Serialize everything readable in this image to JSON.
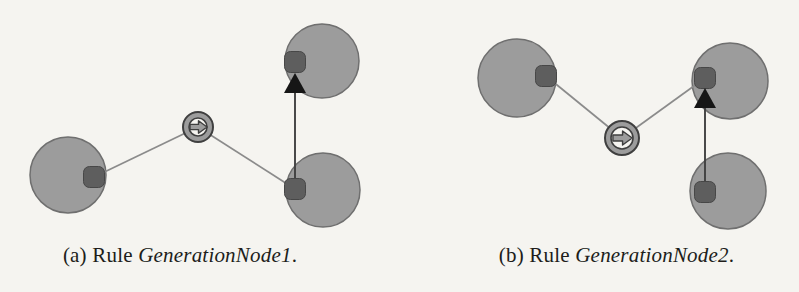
{
  "page": {
    "background": "#f5f4f0"
  },
  "colors": {
    "node_fill": "#9c9c9c",
    "node_stroke": "#6f6f6f",
    "port_fill": "#5e5e5e",
    "port_stroke": "#474747",
    "edge": "#8b8b8b",
    "arrow_line": "#414141",
    "arrow_head": "#161616",
    "icon_ring_fill": "#9c9c9c",
    "icon_stroke": "#3f3f3f",
    "icon_inner_bg": "#f5f4f0",
    "icon_arrow_fill": "#9c9c9c",
    "caption_color": "#201d1a"
  },
  "metrics": {
    "port_size": 21,
    "port_corner_radius": 6,
    "node_stroke_width": 1.5,
    "edge_width": 1.7,
    "arrow_line_width": 1.9,
    "arrow_head_width": 22,
    "arrow_head_height": 20
  },
  "figures": [
    {
      "id": "a",
      "caption": {
        "prefix": "(a) Rule ",
        "rule": "GenerationNode1",
        "suffix": "."
      },
      "svg": {
        "width": 400,
        "height": 234
      },
      "nodes": [
        {
          "name": "left-node",
          "cx": 68,
          "cy": 175,
          "r": 38
        },
        {
          "name": "top-right-node",
          "cx": 322,
          "cy": 61,
          "r": 37
        },
        {
          "name": "bottom-right-node",
          "cx": 323,
          "cy": 190,
          "r": 37
        }
      ],
      "ports": [
        {
          "name": "left-node-port",
          "cx": 94,
          "cy": 177
        },
        {
          "name": "top-right-node-port",
          "cx": 295,
          "cy": 62
        },
        {
          "name": "bottom-right-node-port",
          "cx": 295,
          "cy": 189
        }
      ],
      "edges": [
        {
          "x1": 94,
          "y1": 177,
          "x2": 198,
          "y2": 127
        },
        {
          "x1": 198,
          "y1": 127,
          "x2": 295,
          "y2": 189
        }
      ],
      "arrow": {
        "x": 295,
        "fromY": 189,
        "tipY": 73
      },
      "icon": {
        "cx": 198,
        "cy": 127,
        "r": 15
      }
    },
    {
      "id": "b",
      "caption": {
        "prefix": "(b) Rule ",
        "rule": "GenerationNode2",
        "suffix": "."
      },
      "svg": {
        "width": 399,
        "height": 234
      },
      "nodes": [
        {
          "name": "top-left-node",
          "cx": 117,
          "cy": 78,
          "r": 39
        },
        {
          "name": "top-right-node",
          "cx": 330,
          "cy": 81,
          "r": 38
        },
        {
          "name": "bottom-right-node",
          "cx": 328,
          "cy": 191,
          "r": 38
        }
      ],
      "ports": [
        {
          "name": "top-left-node-port",
          "cx": 146,
          "cy": 76
        },
        {
          "name": "top-right-node-port",
          "cx": 305,
          "cy": 78
        },
        {
          "name": "bottom-right-node-port",
          "cx": 305,
          "cy": 192
        }
      ],
      "edges": [
        {
          "x1": 146,
          "y1": 76,
          "x2": 222,
          "y2": 138
        },
        {
          "x1": 222,
          "y1": 138,
          "x2": 305,
          "y2": 78
        }
      ],
      "arrow": {
        "x": 305,
        "fromY": 192,
        "tipY": 88
      },
      "icon": {
        "cx": 222,
        "cy": 138,
        "r": 17
      }
    }
  ]
}
